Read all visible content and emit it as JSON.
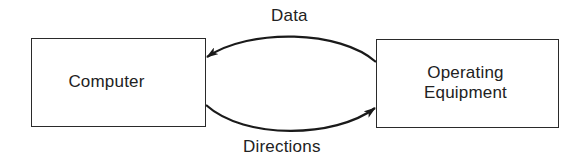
{
  "diagram": {
    "type": "flow",
    "nodes": [
      {
        "id": "computer",
        "label_lines": [
          "Computer"
        ]
      },
      {
        "id": "operating-equipment",
        "label_lines": [
          "Operating",
          "Equipment"
        ]
      }
    ],
    "edges": [
      {
        "from": "operating-equipment",
        "to": "computer",
        "label": "Data",
        "position": "top"
      },
      {
        "from": "computer",
        "to": "operating-equipment",
        "label": "Directions",
        "position": "bottom"
      }
    ],
    "colors": {
      "stroke": "#1a1a1a",
      "background": "#ffffff",
      "text": "#222222"
    }
  }
}
